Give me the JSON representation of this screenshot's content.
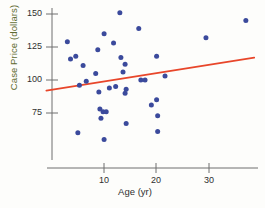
{
  "chart_data": {
    "type": "scatter",
    "title": "",
    "xlabel": "Age (yr)",
    "ylabel": "Case Price (dollars)",
    "xlim": [
      -1,
      40
    ],
    "ylim": [
      50,
      158
    ],
    "xticks": [
      10,
      20,
      30
    ],
    "yticks": [
      75,
      100,
      125,
      150
    ],
    "grid": false,
    "legend": null,
    "point_color": "#3b4a9c",
    "line_color": "#e8462a",
    "axis_color": "#6f6f6f",
    "ylabel_color": "#5d6b2f",
    "points": [
      {
        "x": 3.0,
        "y": 129
      },
      {
        "x": 3.6,
        "y": 116
      },
      {
        "x": 4.6,
        "y": 118
      },
      {
        "x": 5.0,
        "y": 60
      },
      {
        "x": 5.3,
        "y": 96
      },
      {
        "x": 6.0,
        "y": 111
      },
      {
        "x": 6.6,
        "y": 99
      },
      {
        "x": 8.4,
        "y": 105
      },
      {
        "x": 8.8,
        "y": 123
      },
      {
        "x": 9.0,
        "y": 91
      },
      {
        "x": 9.2,
        "y": 78
      },
      {
        "x": 9.4,
        "y": 71
      },
      {
        "x": 9.8,
        "y": 76
      },
      {
        "x": 10.0,
        "y": 135
      },
      {
        "x": 10.0,
        "y": 55
      },
      {
        "x": 10.4,
        "y": 76
      },
      {
        "x": 11.0,
        "y": 94
      },
      {
        "x": 11.8,
        "y": 128
      },
      {
        "x": 12.2,
        "y": 95
      },
      {
        "x": 13.0,
        "y": 151
      },
      {
        "x": 13.2,
        "y": 117
      },
      {
        "x": 13.6,
        "y": 106
      },
      {
        "x": 14.0,
        "y": 112
      },
      {
        "x": 14.2,
        "y": 93
      },
      {
        "x": 14.0,
        "y": 90
      },
      {
        "x": 14.2,
        "y": 67
      },
      {
        "x": 16.6,
        "y": 139
      },
      {
        "x": 17.0,
        "y": 100
      },
      {
        "x": 17.8,
        "y": 100
      },
      {
        "x": 19.0,
        "y": 81
      },
      {
        "x": 20.0,
        "y": 118
      },
      {
        "x": 20.0,
        "y": 85
      },
      {
        "x": 20.2,
        "y": 73
      },
      {
        "x": 20.2,
        "y": 61
      },
      {
        "x": 21.6,
        "y": 103
      },
      {
        "x": 29.4,
        "y": 132
      },
      {
        "x": 37.0,
        "y": 145
      }
    ],
    "trend_line": {
      "x_start": -1.0,
      "y_start": 92.0,
      "x_end": 38.6,
      "y_end": 117.0
    }
  }
}
